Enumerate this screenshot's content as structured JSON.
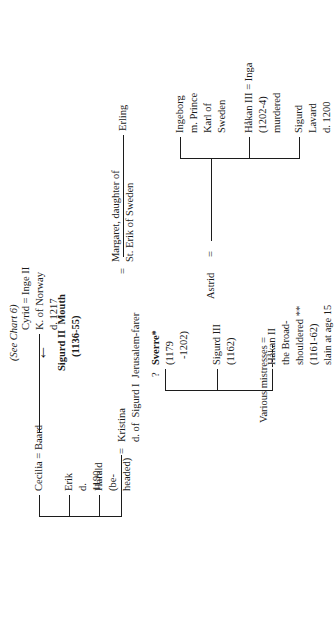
{
  "chart": {
    "title_note": "(See Chart 6)",
    "arrow_icon": "left-arrow",
    "root": {
      "name": "Sigurd II  Mouth",
      "dates": "(1136-55)"
    },
    "spouses": {
      "kristina": {
        "marriage_mark": "=",
        "name": "Kristina",
        "detail": "d. of  Sigurd I  Jerusalem-farer"
      },
      "mistresses": {
        "name": "Various mistresses",
        "marriage_mark": "="
      }
    },
    "children_by_kristina": [
      {
        "id": "harald",
        "line1": "Harald",
        "line2": "(be-",
        "line3": "headed)"
      },
      {
        "id": "erik",
        "line1": "Erik",
        "line2": "d.",
        "line3": "1190"
      },
      {
        "id": "cecilia",
        "line1": "Cecilia = Baard"
      }
    ],
    "cecilia_child": {
      "line1": "Cyrid = Inge II",
      "line2": "K. of Norway",
      "line3": "d. 1217"
    },
    "children_by_mistresses": [
      {
        "id": "hakan-ii",
        "line1": "Håkan II",
        "line2": "the Broad-",
        "line3": "shouldered **",
        "line4": "(1161-62)",
        "line5": "slain at age 15"
      },
      {
        "id": "sigurd-iii",
        "line1": "Sigurd III",
        "line2": "(1162)"
      },
      {
        "id": "sverre",
        "uncertain_mark": "?",
        "line1": "Sverre*",
        "line2": "(1179",
        "line3": "-1202)"
      }
    ],
    "sverre_marriages": {
      "astrid": {
        "name": "Astrid",
        "marriage_mark": "="
      },
      "margaret": {
        "marriage_mark": "=",
        "line1": "Margaret, daughter of",
        "line2": "St. Erik of Sweden"
      }
    },
    "sverre_children": [
      {
        "id": "sigurd-lavard",
        "line1": "Sigurd",
        "line2": "Lavard",
        "line3": "d. 1200"
      },
      {
        "id": "hakan-iii",
        "line1": "Håkan III = Inga",
        "line2": "(1202-4)",
        "line3": "murdered"
      },
      {
        "id": "ingeborg",
        "line1": "Ingeborg",
        "line2": "m. Prince",
        "line3": "Karl of",
        "line4": "Sweden"
      },
      {
        "id": "erling",
        "line1": "Erling"
      }
    ],
    "colors": {
      "ink": "#1c1c1c",
      "paper": "#ffffff"
    }
  }
}
